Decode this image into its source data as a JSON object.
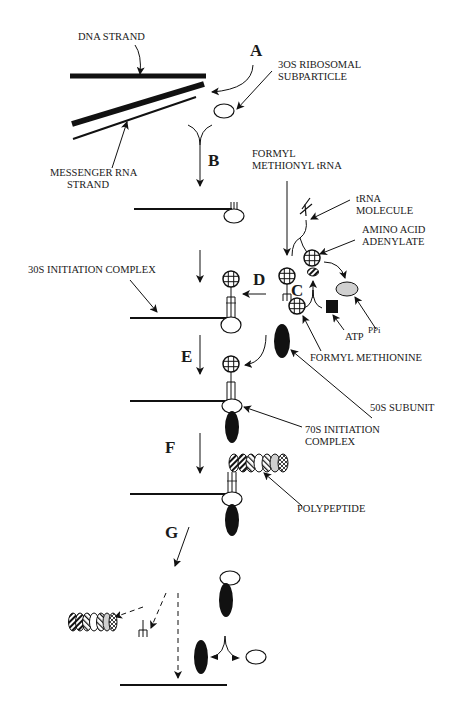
{
  "diagram": {
    "steps": [
      {
        "id": "A",
        "label": "A"
      },
      {
        "id": "B",
        "label": "B"
      },
      {
        "id": "C",
        "label": "C"
      },
      {
        "id": "D",
        "label": "D"
      },
      {
        "id": "E",
        "label": "E"
      },
      {
        "id": "F",
        "label": "F"
      },
      {
        "id": "G",
        "label": "G"
      }
    ],
    "labels": {
      "dna_strand": "DNA STRAND",
      "ribosomal_30s_line1": "3OS RIBOSOMAL",
      "ribosomal_30s_line2": "SUBPARTICLE",
      "mrna_line1": "MESSENGER RNA",
      "mrna_line2": "STRAND",
      "fmet_trna_line1": "FORMYL",
      "fmet_trna_line2": "METHIONYL tRNA",
      "trna_line1": "tRNA",
      "trna_line2": "MOLECULE",
      "aa_adenylate_line1": "AMINO ACID",
      "aa_adenylate_line2": "ADENYLATE",
      "initiation_30s": "30S INITIATION COMPLEX",
      "atp": "ATP",
      "ppi": "PPi",
      "formyl_methionine": "FORMYL METHIONINE",
      "subunit_50s": "50S SUBUNIT",
      "initiation_70s_line1": "70S INITIATION",
      "initiation_70s_line2": "COMPLEX",
      "polypeptide": "POLYPEPTIDE"
    },
    "colors": {
      "ink": "#111111",
      "ppi_fill": "#d0d0d0",
      "background": "#ffffff"
    }
  }
}
